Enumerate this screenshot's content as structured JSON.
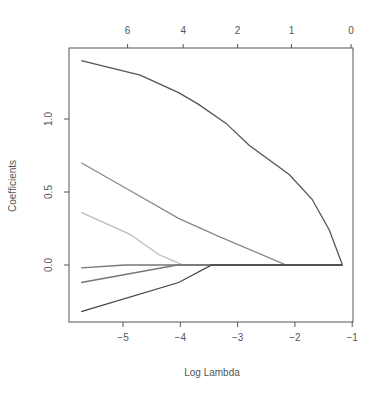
{
  "chart_data": {
    "type": "line",
    "title": "",
    "xlabel": "Log Lambda",
    "ylabel": "Coefficients",
    "xlim": [
      -5.9,
      -0.98
    ],
    "ylim": [
      -0.38,
      1.48
    ],
    "grid": false,
    "legend": null,
    "x_ticks": [
      -5,
      -4,
      -3,
      -2,
      -1
    ],
    "x_tick_labels": [
      "-5",
      "-4",
      "-3",
      "-2",
      "-1"
    ],
    "y_ticks": [
      0.0,
      0.5,
      1.0
    ],
    "y_tick_labels": [
      "0.0",
      "0.5",
      "1.0"
    ],
    "top_axis": {
      "label": "degrees of freedom",
      "ticks_at_x": [
        -4.92,
        -3.95,
        -3.0,
        -2.06,
        -1.02
      ],
      "tick_labels": [
        "6",
        "4",
        "2",
        "1",
        "0"
      ]
    },
    "series": [
      {
        "name": "coef1",
        "color": "#555555",
        "x": [
          -5.73,
          -4.7,
          -4.03,
          -3.68,
          -3.2,
          -2.8,
          -2.1,
          -1.7,
          -1.4,
          -1.17
        ],
        "y": [
          1.4,
          1.3,
          1.18,
          1.1,
          0.97,
          0.82,
          0.62,
          0.45,
          0.24,
          0.0
        ]
      },
      {
        "name": "coef2",
        "color": "#888888",
        "x": [
          -5.73,
          -4.88,
          -4.03,
          -3.35,
          -2.15,
          -1.17
        ],
        "y": [
          0.7,
          0.51,
          0.32,
          0.2,
          0.0,
          0.0
        ]
      },
      {
        "name": "coef3",
        "color": "#bbbbbb",
        "x": [
          -5.73,
          -4.88,
          -4.37,
          -3.95,
          -1.17
        ],
        "y": [
          0.36,
          0.21,
          0.07,
          0.0,
          0.0
        ]
      },
      {
        "name": "coef4",
        "color": "#777777",
        "x": [
          -5.73,
          -4.96,
          -1.17
        ],
        "y": [
          -0.02,
          0.0,
          0.0
        ]
      },
      {
        "name": "coef5",
        "color": "#777777",
        "x": [
          -5.73,
          -4.05,
          -1.17
        ],
        "y": [
          -0.12,
          0.0,
          0.0
        ]
      },
      {
        "name": "coef6",
        "color": "#444444",
        "x": [
          -5.73,
          -4.03,
          -3.45,
          -1.17
        ],
        "y": [
          -0.32,
          -0.12,
          0.0,
          0.0
        ]
      }
    ]
  },
  "layout": {
    "plot_left": 69,
    "plot_right": 353,
    "plot_top": 48,
    "plot_bottom": 322,
    "x_px_per_unit": 57.3,
    "x_px_at_minus5": 123,
    "y_px_at_zero": 265,
    "y_px_per_unit": 146
  }
}
